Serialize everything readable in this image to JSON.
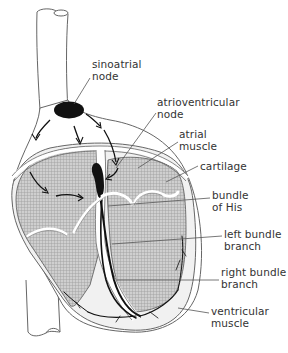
{
  "diagram": {
    "labels": [
      {
        "id": "sinoatrial-node",
        "line1": "sinoatrial",
        "line2": "node",
        "x": 92,
        "y": 58
      },
      {
        "id": "atrioventricular-node",
        "line1": "atrioventricular",
        "line2": "node",
        "x": 157,
        "y": 96
      },
      {
        "id": "atrial-muscle",
        "line1": "atrial",
        "line2": "muscle",
        "x": 179,
        "y": 126
      },
      {
        "id": "cartilage",
        "line1": "cartilage",
        "line2": "",
        "x": 200,
        "y": 160
      },
      {
        "id": "bundle-of-his",
        "line1": "bundle",
        "line2": "of His",
        "x": 212,
        "y": 192
      },
      {
        "id": "left-bundle-branch",
        "line1": "left bundle",
        "line2": "branch",
        "x": 224,
        "y": 230
      },
      {
        "id": "right-bundle-branch",
        "line1": "right bundle",
        "line2": "branch",
        "x": 221,
        "y": 268
      },
      {
        "id": "ventricular-muscle",
        "line1": "ventricular",
        "line2": "muscle",
        "x": 211,
        "y": 307
      }
    ],
    "colors": {
      "outline": "#555555",
      "node": "#111111",
      "hatch_fill": "#b8b8b8",
      "muscle_fill": "#f2f2f2",
      "text": "#333333"
    }
  }
}
